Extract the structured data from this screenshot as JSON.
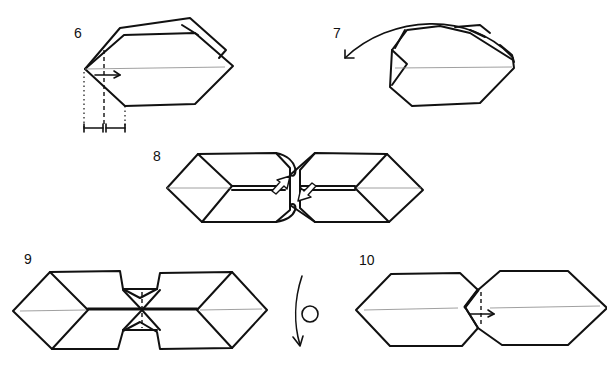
{
  "diagram": {
    "type": "origami-instructions",
    "steps": [
      {
        "number": "6",
        "description": "Fold edge to crease; arrow indicates valley fold to the right with equal-distance markers below"
      },
      {
        "number": "7",
        "description": "Curved arrow indicates turning flap back over the top"
      },
      {
        "number": "8",
        "description": "Two units joined, hollow arrows indicate pushing in the center"
      },
      {
        "number": "9",
        "description": "Joined units; turn-over symbol at right"
      },
      {
        "number": "10",
        "description": "Two hexagonal units interlocked, arrow indicates pull to the right"
      }
    ]
  }
}
